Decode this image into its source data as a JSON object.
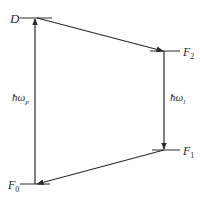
{
  "diagram": {
    "type": "energy-level-cycle",
    "levels": [
      {
        "id": "D",
        "label": "D",
        "sub": ""
      },
      {
        "id": "F2",
        "label": "F",
        "sub": "2"
      },
      {
        "id": "F1",
        "label": "F",
        "sub": "1"
      },
      {
        "id": "F0",
        "label": "F",
        "sub": "0"
      }
    ],
    "transitions": [
      {
        "from": "F0",
        "to": "D",
        "label": "ħω",
        "sub": "p"
      },
      {
        "from": "D",
        "to": "F2",
        "label": "",
        "sub": ""
      },
      {
        "from": "F2",
        "to": "F1",
        "label": "ħω",
        "sub": "l"
      },
      {
        "from": "F1",
        "to": "F0",
        "label": "",
        "sub": ""
      }
    ],
    "colors": {
      "line": "#2a2a2a",
      "background": "#ffffff"
    }
  }
}
